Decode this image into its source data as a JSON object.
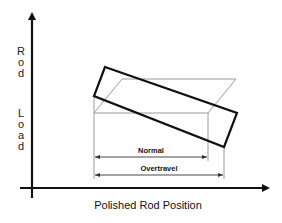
{
  "diagram": {
    "y_axis_label_top": [
      "R",
      "o",
      "d"
    ],
    "y_axis_label_bottom": [
      "L",
      "o",
      "a",
      "d"
    ],
    "x_axis_label": "Polished Rod Position",
    "dimension_labels": {
      "normal": "Normal",
      "overtravel": "Overtravel"
    },
    "shapes": {
      "normal_card": "parallelogram (thin gray outline)",
      "overtravel_card": "tilted rectangle (bold black outline)"
    },
    "colors": {
      "axis": "#111111",
      "bold_shape": "#111111",
      "thin_shape": "#9a9a9a",
      "text": "#111111"
    }
  }
}
